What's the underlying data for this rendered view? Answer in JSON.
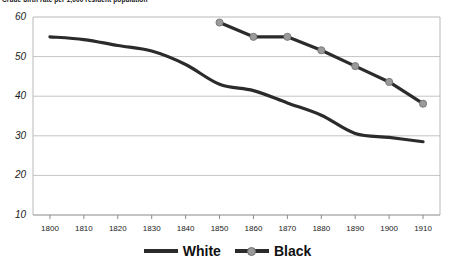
{
  "chart_data": {
    "type": "line",
    "title": "Crude birth rate per 1,000 resident population",
    "xlabel": "",
    "ylabel": "",
    "x": [
      1800,
      1810,
      1820,
      1830,
      1840,
      1850,
      1860,
      1870,
      1880,
      1890,
      1900,
      1910
    ],
    "xlim": [
      1795,
      1915
    ],
    "ylim": [
      10,
      60
    ],
    "yticks": [
      10,
      20,
      30,
      40,
      50,
      60
    ],
    "xticks": [
      1800,
      1810,
      1820,
      1830,
      1840,
      1850,
      1860,
      1870,
      1880,
      1890,
      1900,
      1910
    ],
    "grid": "horizontal",
    "legend_position": "bottom-center",
    "series": [
      {
        "name": "White",
        "color": "#2b2b2b",
        "marker": "none",
        "x": [
          1800,
          1810,
          1820,
          1830,
          1840,
          1850,
          1860,
          1870,
          1880,
          1890,
          1900,
          1910
        ],
        "values": [
          55.0,
          54.3,
          52.8,
          51.4,
          48.0,
          43.0,
          41.4,
          38.3,
          35.2,
          30.6,
          29.6,
          28.5
        ]
      },
      {
        "name": "Black",
        "color": "#2b2b2b",
        "marker": "circle",
        "marker_color": "#9a9a9a",
        "x": [
          1850,
          1860,
          1870,
          1880,
          1890,
          1900,
          1910
        ],
        "values": [
          58.6,
          55.0,
          55.0,
          51.6,
          47.6,
          43.6,
          38.1
        ]
      }
    ]
  },
  "legend": {
    "entries": [
      {
        "label": "White",
        "swatch": "line-swatch"
      },
      {
        "label": "Black",
        "swatch": "line-marker-swatch"
      }
    ]
  },
  "axes": {
    "y_labels": [
      "60",
      "50",
      "40",
      "30",
      "20",
      "10"
    ],
    "x_labels": [
      "1800",
      "1810",
      "1820",
      "1830",
      "1840",
      "1850",
      "1860",
      "1870",
      "1880",
      "1890",
      "1900",
      "1910"
    ]
  }
}
